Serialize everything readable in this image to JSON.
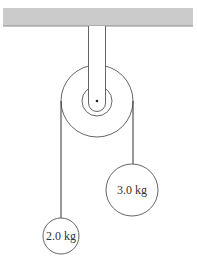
{
  "diagram": {
    "type": "atwood-machine",
    "ceiling": {
      "color": "#cbcbcb",
      "edge_color": "#8a8a8a"
    },
    "pulley": {
      "outer_radius": 36,
      "inner_radius": 15
    },
    "masses": [
      {
        "label": "2.0 kg",
        "side": "left"
      },
      {
        "label": "3.0 kg",
        "side": "right"
      }
    ]
  }
}
